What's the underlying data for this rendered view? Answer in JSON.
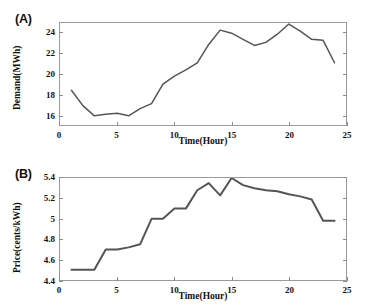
{
  "figure": {
    "panel_a_tag": "(A)",
    "panel_b_tag": "(B)",
    "line_color": "#555555",
    "frame_color": "#9a9a9a",
    "background": "#ffffff"
  },
  "chart_data": [
    {
      "type": "line",
      "panel": "(A)",
      "title": "",
      "xlabel": "Time(Hour)",
      "ylabel": "Demand(MWh)",
      "xlim": [
        0,
        25
      ],
      "ylim": [
        15,
        25
      ],
      "xticks": [
        0,
        5,
        10,
        15,
        20,
        25
      ],
      "xticklabels": [
        "0",
        "5",
        "10",
        "15",
        "20",
        "25"
      ],
      "yticks": [
        16,
        18,
        20,
        22,
        24
      ],
      "yticklabels": [
        "16",
        "18",
        "20",
        "22",
        "24"
      ],
      "grid": false,
      "legend": "none",
      "x": [
        1,
        2,
        3,
        4,
        5,
        6,
        7,
        8,
        9,
        10,
        11,
        12,
        13,
        14,
        15,
        16,
        17,
        18,
        19,
        20,
        21,
        22,
        23,
        24
      ],
      "values": [
        18.4,
        16.9,
        15.9,
        16.05,
        16.15,
        15.9,
        16.6,
        17.1,
        19.0,
        19.8,
        20.4,
        21.1,
        22.9,
        24.3,
        24.0,
        23.4,
        22.8,
        23.1,
        23.9,
        24.9,
        24.2,
        23.4,
        23.3,
        21.1
      ]
    },
    {
      "type": "line",
      "panel": "(B)",
      "title": "",
      "xlabel": "Time(Hour)",
      "ylabel": "Price(cents/kWh)",
      "xlim": [
        0,
        25
      ],
      "ylim": [
        4.4,
        5.4
      ],
      "xticks": [
        0,
        5,
        10,
        15,
        20,
        25
      ],
      "xticklabels": [
        "0",
        "5",
        "10",
        "15",
        "20",
        "25"
      ],
      "yticks": [
        4.4,
        4.6,
        4.8,
        5.0,
        5.2,
        5.4
      ],
      "yticklabels": [
        "4.4",
        "4.6",
        "4.8",
        "5",
        "5.2",
        "5.4"
      ],
      "grid": false,
      "legend": "none",
      "x": [
        1,
        2,
        3,
        4,
        5,
        6,
        7,
        8,
        9,
        10,
        11,
        12,
        13,
        14,
        15,
        16,
        17,
        18,
        19,
        20,
        21,
        22,
        23,
        24
      ],
      "values": [
        4.5,
        4.5,
        4.5,
        4.7,
        4.7,
        4.72,
        4.75,
        5.0,
        5.0,
        5.1,
        5.1,
        5.28,
        5.35,
        5.23,
        5.4,
        5.33,
        5.3,
        5.28,
        5.27,
        5.24,
        5.22,
        5.19,
        4.98,
        4.98
      ]
    }
  ]
}
